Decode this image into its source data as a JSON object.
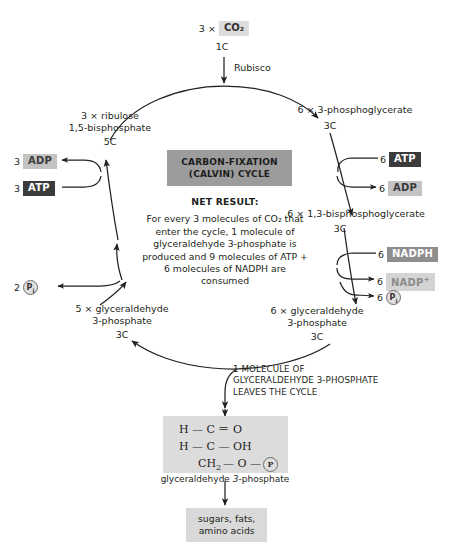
{
  "diagram": {
    "title": "Carbon-fixation (Calvin) cycle",
    "inputs": {
      "co2_coef": "3 ×",
      "co2_label": "CO₂",
      "co2_carbon": "1C",
      "enzyme": "Rubisco"
    },
    "nodes": {
      "ribulose": {
        "line1": "3 × ribulose",
        "line2": "1,5-bisphosphate",
        "carbon": "5C"
      },
      "pga": {
        "line1": "6 × 3-phosphoglycerate",
        "carbon": "3C"
      },
      "bpg": {
        "line1": "6 × 1,3-bisphosphoglycerate",
        "carbon": "3C"
      },
      "g3p_right": {
        "line1": "6 × glyceraldehyde",
        "line2": "3-phosphate",
        "carbon": "3C"
      },
      "g3p_left": {
        "line1": "5 × glyceraldehyde",
        "line2": "3-phosphate",
        "carbon": "3C"
      }
    },
    "center": {
      "title_line1": "CARBON-FIXATION",
      "title_line2": "(CALVIN) CYCLE",
      "net_heading": "NET RESULT:",
      "net_body": "For every 3 molecules of CO₂ that enter the cycle, 1 molecule of glyceraldehyde 3-phosphate is produced and 9 molecules of ATP + 6 molecules of NADPH are consumed"
    },
    "cofactors": {
      "left_adp": {
        "coef": "3",
        "label": "ADP",
        "style": "light"
      },
      "left_atp": {
        "coef": "3",
        "label": "ATP",
        "style": "dark"
      },
      "left_pi": {
        "coef": "2",
        "label": "P",
        "sub": "i",
        "style": "circle"
      },
      "right_atp": {
        "coef": "6",
        "label": "ATP",
        "style": "dark"
      },
      "right_adp": {
        "coef": "6",
        "label": "ADP",
        "style": "light"
      },
      "nadph": {
        "coef": "6",
        "label": "NADPH",
        "style": "mid"
      },
      "nadp_plus": {
        "coef": "6",
        "label": "NADP",
        "sup": "+",
        "style": "pale"
      },
      "right_pi": {
        "coef": "6",
        "label": "P",
        "sub": "i",
        "style": "circle"
      }
    },
    "exit": {
      "line1": "1 MOLECULE OF",
      "line2": "GLYCERALDEHYDE 3-PHOSPHATE",
      "line3": "LEAVES THE CYCLE"
    },
    "molecule": {
      "row1": "H — C ＝ O",
      "row2": "H — C — OH",
      "row3_prefix": "CH",
      "row3_sub": "2",
      "row3_mid": "— O —",
      "row3_p": "P",
      "caption_plain": "glyceraldehyde ",
      "caption_italic": "3",
      "caption_tail": "-phosphate"
    },
    "products": {
      "line1": "sugars, fats,",
      "line2": "amino acids"
    },
    "colors": {
      "atp_badge": "#3b3b3b",
      "adp_badge": "#c3c3c3",
      "nadph_badge": "#8e8e8e",
      "nadp_badge": "#d4d4d4",
      "title_box": "#9c9c9c",
      "molecule_box": "#dcdcdc",
      "product_box": "#d9d9d9",
      "stroke": "#231f20"
    }
  }
}
